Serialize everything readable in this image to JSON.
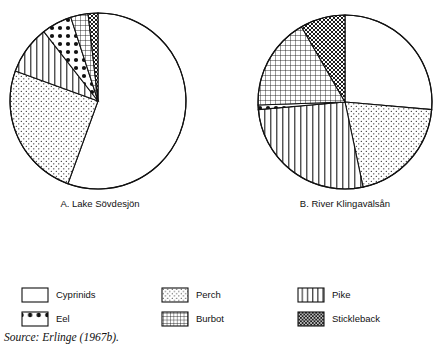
{
  "figure": {
    "source_note": "Source: Erlinge (1967b).",
    "stroke_color": "#000000",
    "background": "#ffffff"
  },
  "charts": [
    {
      "id": "pie-a",
      "caption": "A. Lake Sövdesjön",
      "cx": 98,
      "cy": 101,
      "r": 88
    },
    {
      "id": "pie-b",
      "caption": "B. River Klingavälsån",
      "cx": 345,
      "cy": 102,
      "r": 87
    }
  ],
  "legend": {
    "items": [
      {
        "key": "cyprinids",
        "label": "Cyprinids",
        "pattern": "blank",
        "sx": 22,
        "sy": 288
      },
      {
        "key": "eel",
        "label": "Eel",
        "pattern": "bigdots",
        "sx": 22,
        "sy": 312
      },
      {
        "key": "perch",
        "label": "Perch",
        "pattern": "smalldots",
        "sx": 162,
        "sy": 288
      },
      {
        "key": "burbot",
        "label": "Burbot",
        "pattern": "grid",
        "sx": 162,
        "sy": 312
      },
      {
        "key": "pike",
        "label": "Pike",
        "pattern": "vertical",
        "sx": 298,
        "sy": 288
      },
      {
        "key": "stickleback",
        "label": "Stickleback",
        "pattern": "densehatch",
        "sx": 298,
        "sy": 312
      }
    ],
    "swatch_w": 26,
    "swatch_h": 14
  },
  "chart_data": [
    {
      "type": "pie",
      "title": "A. Lake Sövdesjön",
      "categories": [
        "Cyprinids",
        "Perch",
        "Pike",
        "Eel",
        "Burbot",
        "Stickleback"
      ],
      "values": [
        55.6,
        25.0,
        8.9,
        5.6,
        3.1,
        1.8
      ],
      "units": "percent of prey",
      "angles_deg": [
        {
          "name": "Cyprinids",
          "start": 0,
          "end": 200
        },
        {
          "name": "Perch",
          "start": 200,
          "end": 290
        },
        {
          "name": "Pike",
          "start": 290,
          "end": 322
        },
        {
          "name": "Eel",
          "start": 322,
          "end": 342
        },
        {
          "name": "Burbot",
          "start": 342,
          "end": 353.5
        },
        {
          "name": "Stickleback",
          "start": 353.5,
          "end": 360
        }
      ],
      "legend_position": "bottom",
      "grid": false
    },
    {
      "type": "pie",
      "title": "B. River Klingavälsån",
      "categories": [
        "Cyprinids",
        "Perch",
        "Pike",
        "Eel",
        "Burbot",
        "Stickleback"
      ],
      "values": [
        26.4,
        20.3,
        26.9,
        0.8,
        17.2,
        8.4
      ],
      "units": "percent of prey",
      "angles_deg": [
        {
          "name": "Cyprinids",
          "start": 0,
          "end": 95
        },
        {
          "name": "Perch",
          "start": 95,
          "end": 168
        },
        {
          "name": "Pike",
          "start": 168,
          "end": 265
        },
        {
          "name": "Eel",
          "start": 265,
          "end": 268
        },
        {
          "name": "Burbot",
          "start": 268,
          "end": 330
        },
        {
          "name": "Stickleback",
          "start": 330,
          "end": 360
        }
      ],
      "legend_position": "bottom",
      "grid": false
    }
  ]
}
